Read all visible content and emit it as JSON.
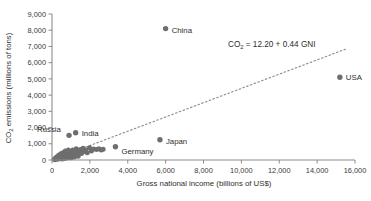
{
  "chart_data": {
    "type": "scatter",
    "title": "",
    "xlabel": "Gross national income (billions of US$)",
    "ylabel": "CO2 emissions (millions of tons)",
    "ylabel_parts": {
      "pre": "CO",
      "sub": "2",
      "post": " emissions (millions of tons)"
    },
    "xlim": [
      0,
      16000
    ],
    "ylim": [
      0,
      9000
    ],
    "xticks": [
      0,
      2000,
      4000,
      6000,
      8000,
      10000,
      12000,
      14000,
      16000
    ],
    "xtick_labels": [
      "0",
      "2,000",
      "4,000",
      "6,000",
      "8,000",
      "10,000",
      "12,000",
      "14,000",
      "16,000"
    ],
    "yticks": [
      0,
      1000,
      2000,
      3000,
      4000,
      5000,
      6000,
      7000,
      8000,
      9000
    ],
    "ytick_labels": [
      "0",
      "1,000",
      "2,000",
      "3,000",
      "4,000",
      "5,000",
      "6,000",
      "7,000",
      "8,000",
      "9,000"
    ],
    "grid": false,
    "legend": "none",
    "annotation": {
      "text": "CO2 = 12.20 + 0.44 GNI",
      "parts": {
        "pre": "CO",
        "sub": "2",
        "post": " = 12.20 + 0.44 GNI"
      },
      "intercept": 12.2,
      "slope": 0.44
    },
    "fit_line": {
      "style": "dotted",
      "x_start": 0,
      "x_end": 15600
    },
    "labeled_points": [
      {
        "label": "China",
        "x": 6000,
        "y": 8100,
        "label_dx": 6,
        "label_dy": 4
      },
      {
        "label": "USA",
        "x": 15200,
        "y": 5100,
        "label_dx": 6,
        "label_dy": 3
      },
      {
        "label": "India",
        "x": 1250,
        "y": 1680,
        "label_dx": 6,
        "label_dy": 3
      },
      {
        "label": "Russia",
        "x": 900,
        "y": 1520,
        "label_dx": -32,
        "label_dy": -3
      },
      {
        "label": "Japan",
        "x": 5700,
        "y": 1250,
        "label_dx": 6,
        "label_dy": 4
      },
      {
        "label": "Germany",
        "x": 3350,
        "y": 820,
        "label_dx": 6,
        "label_dy": 7
      }
    ],
    "unlabeled_points": [
      {
        "x": 120,
        "y": 60
      },
      {
        "x": 200,
        "y": 120
      },
      {
        "x": 260,
        "y": 90
      },
      {
        "x": 330,
        "y": 200
      },
      {
        "x": 380,
        "y": 150
      },
      {
        "x": 430,
        "y": 260
      },
      {
        "x": 470,
        "y": 110
      },
      {
        "x": 520,
        "y": 320
      },
      {
        "x": 560,
        "y": 230
      },
      {
        "x": 610,
        "y": 400
      },
      {
        "x": 650,
        "y": 180
      },
      {
        "x": 690,
        "y": 300
      },
      {
        "x": 720,
        "y": 470
      },
      {
        "x": 760,
        "y": 240
      },
      {
        "x": 800,
        "y": 360
      },
      {
        "x": 840,
        "y": 200
      },
      {
        "x": 880,
        "y": 430
      },
      {
        "x": 920,
        "y": 290
      },
      {
        "x": 960,
        "y": 540
      },
      {
        "x": 1000,
        "y": 330
      },
      {
        "x": 1060,
        "y": 250
      },
      {
        "x": 1100,
        "y": 620
      },
      {
        "x": 1150,
        "y": 420
      },
      {
        "x": 1200,
        "y": 300
      },
      {
        "x": 1280,
        "y": 700
      },
      {
        "x": 1340,
        "y": 480
      },
      {
        "x": 1420,
        "y": 560
      },
      {
        "x": 1500,
        "y": 640
      },
      {
        "x": 1560,
        "y": 400
      },
      {
        "x": 1640,
        "y": 720
      },
      {
        "x": 1700,
        "y": 520
      },
      {
        "x": 1780,
        "y": 610
      },
      {
        "x": 1860,
        "y": 450
      },
      {
        "x": 1980,
        "y": 760
      },
      {
        "x": 2080,
        "y": 560
      },
      {
        "x": 2200,
        "y": 680
      },
      {
        "x": 2350,
        "y": 640
      },
      {
        "x": 2480,
        "y": 700
      },
      {
        "x": 2600,
        "y": 620
      },
      {
        "x": 2700,
        "y": 660
      },
      {
        "x": 150,
        "y": 20
      },
      {
        "x": 290,
        "y": 40
      },
      {
        "x": 410,
        "y": 70
      },
      {
        "x": 540,
        "y": 55
      },
      {
        "x": 660,
        "y": 95
      },
      {
        "x": 780,
        "y": 130
      },
      {
        "x": 900,
        "y": 160
      },
      {
        "x": 1020,
        "y": 140
      },
      {
        "x": 1180,
        "y": 190
      },
      {
        "x": 1380,
        "y": 230
      },
      {
        "x": 240,
        "y": 180
      },
      {
        "x": 350,
        "y": 300
      },
      {
        "x": 460,
        "y": 380
      },
      {
        "x": 580,
        "y": 450
      },
      {
        "x": 700,
        "y": 560
      },
      {
        "x": 620,
        "y": 160
      },
      {
        "x": 500,
        "y": 200
      },
      {
        "x": 400,
        "y": 240
      },
      {
        "x": 310,
        "y": 110
      },
      {
        "x": 860,
        "y": 620
      }
    ]
  },
  "geometry": {
    "plot_left": 52,
    "plot_right": 355,
    "plot_top": 14,
    "plot_bottom": 160
  }
}
